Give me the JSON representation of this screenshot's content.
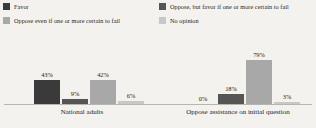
{
  "chart_data": {
    "type": "bar",
    "title": "",
    "subtitle": "",
    "xlabel": "",
    "ylabel": "",
    "grid": false,
    "legend_position": "top",
    "ylim": [
      0,
      100
    ],
    "value_suffix": "%",
    "categories": [
      "National adults",
      "Oppose assistance on initial question"
    ],
    "series": [
      {
        "name": "Favor",
        "color": "#3a3a3a",
        "values": [
          43,
          0
        ],
        "labels": [
          "43%",
          "0%"
        ]
      },
      {
        "name": "Oppose, but favor if one or more certain to fail",
        "color": "#555555",
        "values": [
          9,
          18
        ],
        "labels": [
          "9%",
          "18%"
        ]
      },
      {
        "name": "Oppose even if one or more certain to fail",
        "color": "#a8a8a8",
        "values": [
          42,
          79
        ],
        "labels": [
          "42%",
          "79%"
        ]
      },
      {
        "name": "No opinion",
        "color": "#c8c8c8",
        "values": [
          6,
          3
        ],
        "labels": [
          "6%",
          "3%"
        ]
      }
    ],
    "legend_order": [
      0,
      2,
      1,
      3
    ]
  },
  "legend": {
    "items": [
      {
        "label": "Favor",
        "color": "#3a3a3a"
      },
      {
        "label": "Oppose even if one or more certain to fail",
        "color": "#a8a8a8"
      },
      {
        "label": "Oppose, but favor if one or more certain to fail",
        "color": "#555555"
      },
      {
        "label": "No opinion",
        "color": "#c8c8c8"
      }
    ]
  },
  "axis": {
    "baseline_color": "#b9b5ad"
  },
  "groups": [
    {
      "label": "National adults",
      "bars": [
        {
          "series": "Favor",
          "value": 43,
          "label": "43%",
          "color": "#3a3a3a"
        },
        {
          "series": "Oppose, but favor if one or more certain to fail",
          "value": 9,
          "label": "9%",
          "color": "#555555"
        },
        {
          "series": "Oppose even if one or more certain to fail",
          "value": 42,
          "label": "42%",
          "color": "#a8a8a8"
        },
        {
          "series": "No opinion",
          "value": 6,
          "label": "6%",
          "color": "#c8c8c8"
        }
      ]
    },
    {
      "label": "Oppose assistance on initial question",
      "bars": [
        {
          "series": "Favor",
          "value": 0,
          "label": "0%",
          "color": "#3a3a3a"
        },
        {
          "series": "Oppose, but favor if one or more certain to fail",
          "value": 18,
          "label": "18%",
          "color": "#555555"
        },
        {
          "series": "Oppose even if one or more certain to fail",
          "value": 79,
          "label": "79%",
          "color": "#a8a8a8"
        },
        {
          "series": "No opinion",
          "value": 3,
          "label": "3%",
          "color": "#c8c8c8"
        }
      ]
    }
  ]
}
